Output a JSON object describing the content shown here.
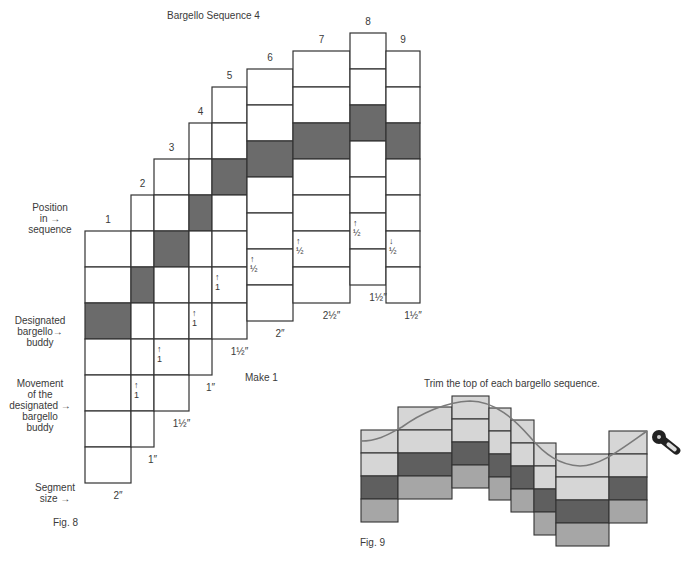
{
  "fig8": {
    "title": "Bargello Sequence 4",
    "caption": "Fig. 8",
    "make_label": "Make 1",
    "row_height": 36,
    "rows_per_column": 7,
    "shaded_row_index": 2,
    "arrow_row_index": 5,
    "colors": {
      "shaded": "#6b6b6b",
      "cell": "#ffffff",
      "stroke": "#333333"
    },
    "side_labels": {
      "position": [
        "Position",
        "in",
        "sequence"
      ],
      "designated": [
        "Designated",
        "bargello",
        "buddy"
      ],
      "movement": [
        "Movement",
        "of the",
        "designated",
        "bargello",
        "buddy"
      ],
      "segment": [
        "Segment",
        "size"
      ]
    },
    "columns": [
      {
        "number": "1",
        "x": 85,
        "width": 46,
        "top": 231,
        "segment_size": "2″",
        "arrow": null,
        "arrow_dir": null
      },
      {
        "number": "2",
        "x": 131,
        "width": 23,
        "top": 195,
        "segment_size": "1″",
        "arrow": "1",
        "arrow_dir": "up"
      },
      {
        "number": "3",
        "x": 154,
        "width": 35,
        "top": 159,
        "segment_size": "1½″",
        "arrow": "1",
        "arrow_dir": "up"
      },
      {
        "number": "4",
        "x": 189,
        "width": 23,
        "top": 123,
        "segment_size": "1″",
        "arrow": "1",
        "arrow_dir": "up"
      },
      {
        "number": "5",
        "x": 212,
        "width": 35,
        "top": 87,
        "segment_size": "1½″",
        "arrow": "1",
        "arrow_dir": "up"
      },
      {
        "number": "6",
        "x": 247,
        "width": 46,
        "top": 69,
        "segment_size": "2″",
        "arrow": "½",
        "arrow_dir": "up"
      },
      {
        "number": "7",
        "x": 293,
        "width": 57,
        "top": 51,
        "segment_size": "2½″",
        "arrow": "½",
        "arrow_dir": "up"
      },
      {
        "number": "8",
        "x": 350,
        "width": 36,
        "top": 33,
        "segment_size": "1½″",
        "arrow": "½",
        "arrow_dir": "up"
      },
      {
        "number": "9",
        "x": 386,
        "width": 34,
        "top": 51,
        "segment_size": "1½″",
        "arrow": "½",
        "arrow_dir": "down"
      }
    ]
  },
  "fig9": {
    "title": "Trim the top of each bargello sequence.",
    "caption": "Fig. 9",
    "row_height": 23,
    "colors": {
      "light": "#d6d6d6",
      "dark": "#5f5f5f",
      "mid": "#a6a6a6",
      "stroke": "#333333",
      "curve": "#7a7a7a"
    },
    "row_pattern": [
      "light",
      "light",
      "dark",
      "mid"
    ],
    "columns": [
      {
        "x": 361,
        "width": 37,
        "top": 430
      },
      {
        "x": 398,
        "width": 54,
        "top": 407
      },
      {
        "x": 452,
        "width": 37,
        "top": 396
      },
      {
        "x": 489,
        "width": 22,
        "top": 408
      },
      {
        "x": 511,
        "width": 23,
        "top": 420
      },
      {
        "x": 534,
        "width": 22,
        "top": 443
      },
      {
        "x": 556,
        "width": 53,
        "top": 454
      },
      {
        "x": 609,
        "width": 38,
        "top": 431
      }
    ],
    "tool": "rotary-cutter-icon"
  }
}
